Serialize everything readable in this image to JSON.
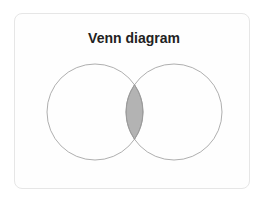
{
  "card": {
    "title": "Venn diagram"
  },
  "venn": {
    "sets": [
      {
        "name": "left-set",
        "cx": 95,
        "cy": 112,
        "r": 48
      },
      {
        "name": "right-set",
        "cx": 174,
        "cy": 112,
        "r": 48
      }
    ],
    "intersection_fill": "#b3b3b3",
    "stroke": "#9a9a9a"
  }
}
